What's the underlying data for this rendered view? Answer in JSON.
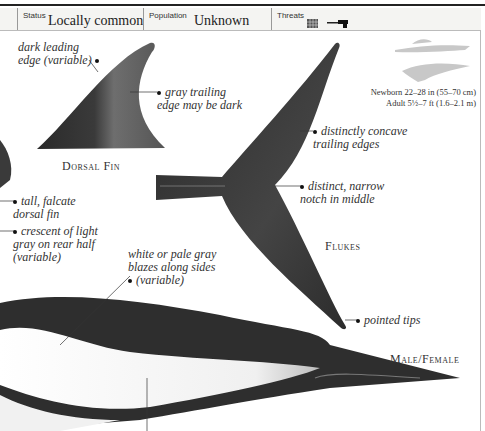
{
  "status_bar": {
    "status": {
      "label": "Status",
      "value": "Locally common"
    },
    "population": {
      "label": "Population",
      "value": "Unknown"
    },
    "threats": {
      "label": "Threats",
      "icons": [
        "fishing-net-icon",
        "harpoon-gun-icon"
      ]
    }
  },
  "size_info": {
    "newborn": "Newborn 22–28 in (55–70 cm)",
    "adult": "Adult 5½–7 ft (1.6–2.1 m)",
    "scale_icons": [
      "human-swimmer-silhouette-icon",
      "dolphin-silhouette-icon"
    ]
  },
  "captions": {
    "dorsal_fin": "Dorsal Fin",
    "flukes": "Flukes",
    "male_female": "Male/Female"
  },
  "annotations": {
    "dark_leading_edge": [
      "dark leading",
      "edge (variable)"
    ],
    "gray_trailing_edge": [
      "gray trailing",
      "edge may be dark"
    ],
    "concave_trailing_edges": [
      "distinctly concave",
      "trailing edges"
    ],
    "narrow_notch": [
      "distinct, narrow",
      "notch in middle"
    ],
    "tall_falcate": [
      "tall, falcate",
      "dorsal fin"
    ],
    "crescent_light_gray": [
      "crescent of light",
      "gray on rear half",
      "(variable)"
    ],
    "white_blazes": [
      "white or pale gray",
      "blazes along sides",
      "(variable)"
    ],
    "pointed_tips": [
      "pointed tips"
    ]
  },
  "colors": {
    "fin_dark": "#2b2b2b",
    "fin_gray": "#6a6a6a",
    "body_dark": "#2e2e2e",
    "blaze": "#f4f4f4",
    "silhouette": "#c8c8c8",
    "bar_bg": "#f4f4f2"
  }
}
